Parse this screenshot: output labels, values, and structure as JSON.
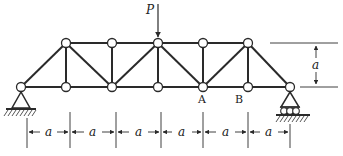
{
  "diagram": {
    "type": "truss",
    "load": {
      "label": "P",
      "node_x": 158
    },
    "point_labels": [
      {
        "label": "A",
        "x": 203
      },
      {
        "label": "B",
        "x": 248
      }
    ],
    "height_dimension": {
      "label": "a"
    },
    "panel_dimensions": [
      "a",
      "a",
      "a",
      "a",
      "a",
      "a"
    ],
    "supports": {
      "left": "pin",
      "right": "roller"
    },
    "colors": {
      "line": "#2a2a2a",
      "node_fill": "#ffffff"
    }
  }
}
